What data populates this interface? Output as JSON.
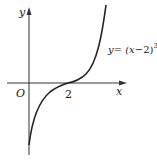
{
  "figure": {
    "type": "function-graph",
    "axes": {
      "x_label": "x",
      "y_label": "y",
      "origin_label": "O",
      "x_tick_labels": [
        "2"
      ]
    },
    "curve": {
      "equation_prefix": "y= (x",
      "equation_minus": "−2)",
      "exponent": "3",
      "equation_text": "y = (x−2)^3",
      "inflection_point": [
        2,
        0
      ]
    },
    "colors": {
      "stroke": "#222222",
      "background": "#ffffff"
    }
  }
}
